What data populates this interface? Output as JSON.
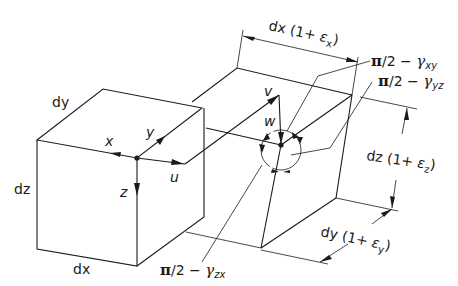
{
  "figure": {
    "undeformed_element": {
      "edge_labels": {
        "dx": "dx",
        "dy": "dy",
        "dz": "dz"
      },
      "axis_labels": {
        "x": "x",
        "y": "y",
        "z": "z"
      },
      "displacement_labels": {
        "u": "u"
      }
    },
    "deformed_element": {
      "displacement_labels": {
        "v": "v",
        "w": "w"
      },
      "dimension_labels": {
        "dx": {
          "prefix": "dx (1+ ",
          "eps": "ε",
          "sub": "x",
          "suffix": ")"
        },
        "dy": {
          "prefix": "dy (1+ ",
          "eps": "ε",
          "sub": "y",
          "suffix": ")"
        },
        "dz": {
          "prefix": "dz (1+ ",
          "eps": "ε",
          "sub": "z",
          "suffix": ")"
        }
      },
      "angle_labels": {
        "xy": {
          "pi": "π",
          "rest": "/2 − ",
          "gamma": "γ",
          "sub": "xy"
        },
        "yz": {
          "pi": "π",
          "rest": "/2 − ",
          "gamma": "γ",
          "sub": "yz"
        },
        "zx": {
          "pi": "π",
          "rest": "/2 − ",
          "gamma": "γ",
          "sub": "zx"
        }
      }
    },
    "colors": {
      "line": "#1a1a1a",
      "background": "#ffffff"
    }
  }
}
